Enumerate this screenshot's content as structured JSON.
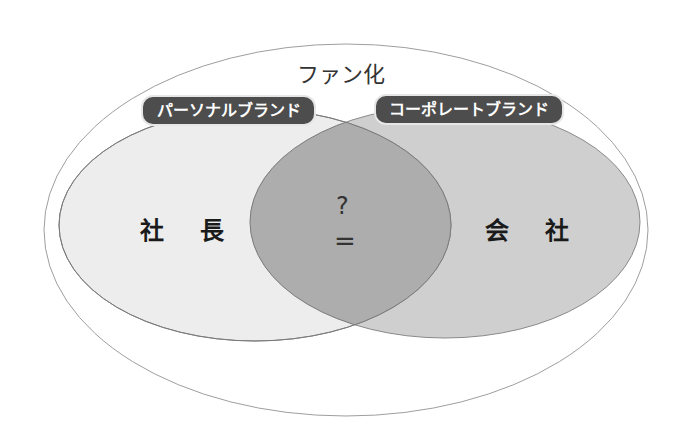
{
  "diagram": {
    "title": "ファン化",
    "left_set": {
      "tag": "パーソナルブランド",
      "label": "社 長",
      "fill": "#ececec"
    },
    "right_set": {
      "tag": "コーポレートブランド",
      "label": "会 社",
      "fill": "#cfcfcf"
    },
    "intersection": {
      "top_text": "?",
      "bottom_text": "=",
      "fill": "#adadad"
    },
    "outer_ellipse_stroke": "#9a9a9a",
    "tag_fill": "#4d4d4d"
  }
}
